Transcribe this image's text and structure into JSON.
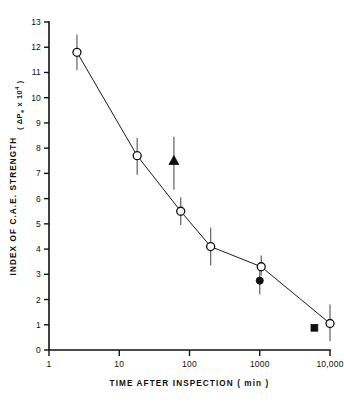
{
  "chart_data": {
    "type": "scatter",
    "title": "",
    "xlabel": "TIME  AFTER  INSPECTION   ( min )",
    "ylabel": "INDEX OF C.A.E. STRENGTH",
    "ylabel_units": "( ΔP",
    "ylabel_units_sub": "e",
    "ylabel_units_mid": " x 10",
    "ylabel_units_sup": "4",
    "ylabel_units_end": " )",
    "xscale": "log",
    "yscale": "linear",
    "xlim": [
      1,
      10000
    ],
    "ylim": [
      0,
      13
    ],
    "grid": false,
    "legend": "none",
    "xticks": [
      1,
      10,
      100,
      1000,
      10000
    ],
    "xticklabels": [
      "1",
      "10",
      "100",
      "1000",
      "10,000"
    ],
    "yticks": [
      0,
      1,
      2,
      3,
      4,
      5,
      6,
      7,
      8,
      9,
      10,
      11,
      12,
      13
    ],
    "yticklabels": [
      "0",
      "1",
      "2",
      "3",
      "4",
      "5",
      "6",
      "7",
      "8",
      "9",
      "10",
      "11",
      "12",
      "13"
    ],
    "series": [
      {
        "name": "open-circle-main",
        "marker": "open-circle",
        "connected": true,
        "points": [
          {
            "x": 2.5,
            "y": 11.8,
            "yerr_low": 11.1,
            "yerr_high": 12.5
          },
          {
            "x": 18,
            "y": 7.7,
            "yerr_low": 6.95,
            "yerr_high": 8.4
          },
          {
            "x": 75,
            "y": 5.5,
            "yerr_low": 4.95,
            "yerr_high": 6.05
          },
          {
            "x": 200,
            "y": 4.1,
            "yerr_low": 3.35,
            "yerr_high": 4.85
          },
          {
            "x": 1050,
            "y": 3.3,
            "yerr_low": 2.95,
            "yerr_high": 3.75
          },
          {
            "x": 10000,
            "y": 1.05,
            "yerr_low": 0.35,
            "yerr_high": 1.8
          }
        ]
      },
      {
        "name": "filled-triangle",
        "marker": "filled-triangle",
        "connected": false,
        "points": [
          {
            "x": 60,
            "y": 7.5,
            "yerr_low": 6.35,
            "yerr_high": 8.45
          }
        ]
      },
      {
        "name": "filled-circle",
        "marker": "filled-circle",
        "connected": false,
        "points": [
          {
            "x": 1000,
            "y": 2.75,
            "yerr_low": 2.2,
            "yerr_high": 3.25
          }
        ]
      },
      {
        "name": "filled-square",
        "marker": "filled-square",
        "connected": false,
        "points": [
          {
            "x": 6000,
            "y": 0.88,
            "yerr_low": 0.88,
            "yerr_high": 0.88
          }
        ]
      }
    ]
  },
  "colors": {
    "axis": "#111111",
    "line": "#1b1b1b",
    "error_bar": "#6d6d6d",
    "marker_fill": "#101010",
    "marker_open_fill": "#ffffff",
    "background": "#ffffff"
  }
}
